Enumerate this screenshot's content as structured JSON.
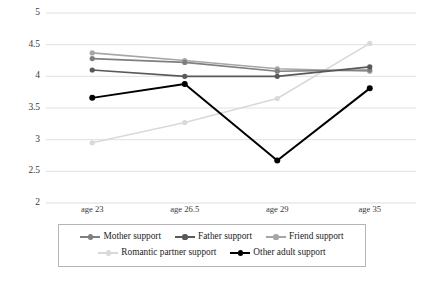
{
  "chart_data": {
    "type": "line",
    "title": "",
    "subtitle": "",
    "xlabel": "",
    "ylabel": "",
    "categories": [
      "age 23",
      "age 26.5",
      "age 29",
      "age 35"
    ],
    "ylim": [
      2,
      5
    ],
    "yticks": [
      "2",
      "2.5",
      "3",
      "3.5",
      "4",
      "4.5",
      "5"
    ],
    "ytick_values": [
      2,
      2.5,
      3,
      3.5,
      4,
      4.5,
      5
    ],
    "grid": true,
    "legend_position": "bottom",
    "series": [
      {
        "name": "Mother support",
        "color": "#7f7f7f",
        "marker": "circle",
        "values": [
          4.28,
          4.22,
          4.08,
          4.1
        ]
      },
      {
        "name": "Father support",
        "color": "#595959",
        "marker": "circle",
        "values": [
          4.1,
          4.0,
          4.0,
          4.15
        ]
      },
      {
        "name": "Friend support",
        "color": "#a6a6a6",
        "marker": "circle",
        "values": [
          4.37,
          4.25,
          4.12,
          4.08
        ]
      },
      {
        "name": "Romantic partner support",
        "color": "#d9d9d9",
        "marker": "circle",
        "values": [
          2.95,
          3.27,
          3.65,
          4.52
        ]
      },
      {
        "name": "Other adult support",
        "color": "#000000",
        "marker": "circle",
        "values": [
          3.66,
          3.88,
          2.67,
          3.81
        ]
      }
    ]
  },
  "legend": {
    "rows": [
      [
        "Mother support",
        "Father support",
        "Friend support"
      ],
      [
        "Romantic partner support",
        "Other adult support"
      ]
    ]
  },
  "axes": {
    "gridline_color": "#d9d9d9",
    "tick_label_color": "#3a3a3a"
  }
}
